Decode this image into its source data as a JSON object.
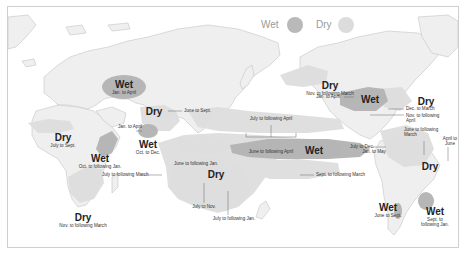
{
  "legend": {
    "wet_label": "Wet",
    "dry_label": "Dry",
    "wet_color": "#b9b9b9",
    "dry_color": "#dcdcdc"
  },
  "colors": {
    "land": "#efefef",
    "border": "#c4c4c4",
    "wet_fill": "#b3b3b3",
    "dry_fill": "#dedede",
    "leader": "#666666"
  },
  "regions": [
    {
      "id": "central-asia",
      "type": "Wet",
      "period": "Jan. to April"
    },
    {
      "id": "india",
      "type": "Dry",
      "period": "June to Sept."
    },
    {
      "id": "sri-lanka",
      "type": "Wet",
      "period": "Oct. to Dec."
    },
    {
      "id": "sri-lanka-jan",
      "type": "",
      "period": "Jan. to April"
    },
    {
      "id": "west-africa",
      "type": "Dry",
      "period": "July to Sept."
    },
    {
      "id": "east-africa",
      "type": "Wet",
      "period": "Oct. to following Jan."
    },
    {
      "id": "southern-africa",
      "type": "Dry",
      "period": "Nov. to following March"
    },
    {
      "id": "indonesia-australia",
      "type": "Dry",
      "period": "June to following Jan."
    },
    {
      "id": "indonesia-march",
      "type": "",
      "period": "July to following March"
    },
    {
      "id": "australia-north",
      "type": "",
      "period": "July to Nov."
    },
    {
      "id": "australia-east",
      "type": "",
      "period": "July to following Jan."
    },
    {
      "id": "central-pacific-north",
      "type": "",
      "period": "July to following April"
    },
    {
      "id": "central-pacific",
      "type": "Wet",
      "period": "June to following April"
    },
    {
      "id": "south-pacific",
      "type": "",
      "period": "Sept. to following March"
    },
    {
      "id": "alaska",
      "type": "Dry",
      "period": "Nov. to following March"
    },
    {
      "id": "us-south",
      "type": "Wet",
      "period": "Jan. to April"
    },
    {
      "id": "eastern-us",
      "type": "Dry",
      "period": "Dec. to March"
    },
    {
      "id": "gulf",
      "type": "",
      "period": "Nov. to following April"
    },
    {
      "id": "central-america",
      "type": "",
      "period": "June to following March"
    },
    {
      "id": "central-america-dec",
      "type": "",
      "period": "July to Dec."
    },
    {
      "id": "brazil",
      "type": "Dry",
      "period": "April to June"
    },
    {
      "id": "ecuador",
      "type": "",
      "period": "Jan. to May"
    },
    {
      "id": "chile",
      "type": "Wet",
      "period": "June to Sept."
    },
    {
      "id": "se-south-america",
      "type": "Wet",
      "period": "Sept. to following Jan."
    }
  ]
}
